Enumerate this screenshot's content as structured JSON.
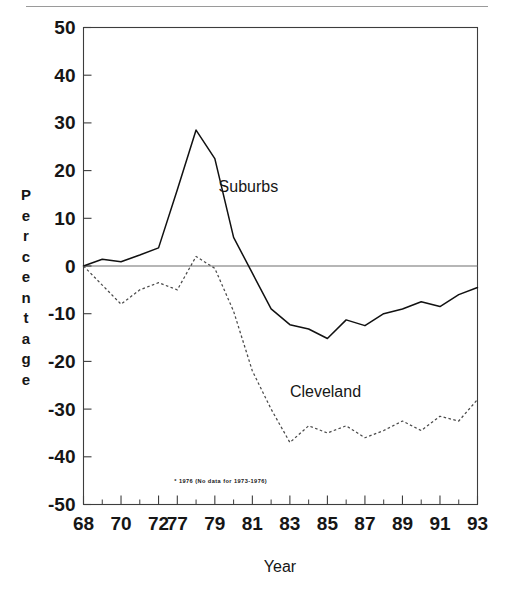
{
  "chart_data": {
    "type": "line",
    "title": "",
    "xlabel": "Year",
    "ylabel": "Percentage",
    "ylim": [
      -50,
      50
    ],
    "xlim": [
      1968,
      1993
    ],
    "grid": false,
    "legend_position": "inline-annotation",
    "ytick_labels": [
      "50",
      "40",
      "30",
      "20",
      "10",
      "0",
      "-10",
      "-20",
      "-30",
      "-40",
      "-50"
    ],
    "ytick_values": [
      50,
      40,
      30,
      20,
      10,
      0,
      -10,
      -20,
      -30,
      -40,
      -50
    ],
    "xtick_labels": [
      "68",
      "70",
      "72",
      "77",
      "79",
      "81",
      "83",
      "85",
      "87",
      "89",
      "91",
      "93"
    ],
    "xtick_values": [
      1968,
      1970,
      1972,
      1977,
      1979,
      1981,
      1983,
      1985,
      1987,
      1989,
      1991,
      1993
    ],
    "x": [
      1968,
      1969,
      1970,
      1971,
      1972,
      1977,
      1978,
      1979,
      1980,
      1981,
      1982,
      1983,
      1984,
      1985,
      1986,
      1987,
      1988,
      1989,
      1990,
      1991,
      1992,
      1993
    ],
    "series": [
      {
        "name": "Suburbs",
        "style": "solid",
        "color": "#111111",
        "label_x": 1979.2,
        "label_y": 15.5,
        "values": [
          0.0,
          1.4,
          0.9,
          2.3,
          3.8,
          16.0,
          28.5,
          22.5,
          6.0,
          -1.5,
          -9.0,
          -12.3,
          -13.2,
          -15.2,
          -11.3,
          -12.5,
          -10.0,
          -9.0,
          -7.5,
          -8.5,
          -6.0,
          -4.5
        ]
      },
      {
        "name": "Cleveland",
        "style": "dotted",
        "color": "#4a4a4a",
        "label_x": 1983.0,
        "label_y": -27.5,
        "values": [
          0.0,
          -4.0,
          -8.0,
          -5.0,
          -3.5,
          -5.0,
          2.0,
          -0.5,
          -9.5,
          -22.0,
          -30.0,
          -37.0,
          -33.5,
          -35.0,
          -33.5,
          -36.0,
          -34.5,
          -32.5,
          -34.5,
          -31.5,
          -32.5,
          -28.0
        ]
      }
    ],
    "annotations": [
      {
        "name": "missing-data-footnote",
        "text": "* 1976 (No data for 1973-1976)",
        "x": 1976.2,
        "y": -45.5
      }
    ]
  },
  "axis": {
    "ylabel_letters": [
      "P",
      "e",
      "r",
      "c",
      "e",
      "n",
      "t",
      "a",
      "g",
      "e"
    ],
    "xlabel": "Year"
  },
  "colors": {
    "frame": "#3d3d3d",
    "zero_line": "#6e6e6e",
    "suburbs": "#111111",
    "cleveland": "#4a4a4a",
    "background": "#ffffff",
    "top_rule": "#9a9a9a"
  }
}
